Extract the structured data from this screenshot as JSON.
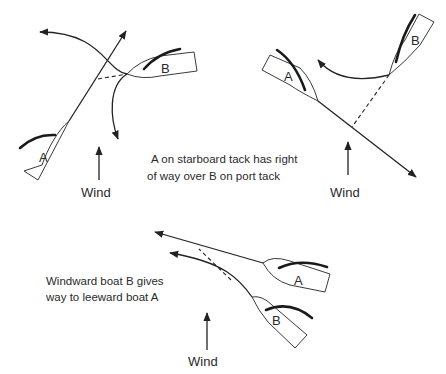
{
  "diagram": {
    "panels": [
      {
        "id": "port-starboard-crossing-1",
        "boats": [
          {
            "label": "A"
          },
          {
            "label": "B"
          }
        ],
        "wind_label": "Wind"
      },
      {
        "id": "port-starboard-crossing-2",
        "boats": [
          {
            "label": "A"
          },
          {
            "label": "B"
          }
        ],
        "wind_label": "Wind"
      },
      {
        "id": "windward-leeward",
        "boats": [
          {
            "label": "A"
          },
          {
            "label": "B"
          }
        ],
        "wind_label": "Wind"
      }
    ],
    "captions": {
      "starboard_rule_line1": "A on starboard tack has right",
      "starboard_rule_line2": "of way over B on port tack",
      "windward_rule_line1": "Windward boat B gives",
      "windward_rule_line2": "way to leeward boat A"
    },
    "colors": {
      "ink": "#222222",
      "background": "#ffffff"
    }
  }
}
